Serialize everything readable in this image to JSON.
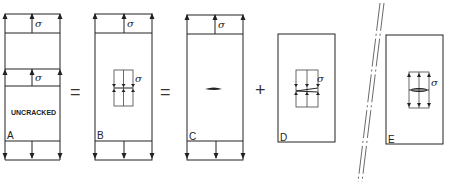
{
  "figure": {
    "panels": [
      {
        "id": "A",
        "label": "A",
        "center_text": "UNCRACKED",
        "stress_symbol_top": "σ",
        "stress_symbol_mid": "σ"
      },
      {
        "id": "B",
        "label": "B",
        "stress_symbol_top": "σ",
        "stress_symbol_inner": "σ"
      },
      {
        "id": "C",
        "label": "C",
        "stress_symbol_top": "σ"
      },
      {
        "id": "D",
        "label": "D",
        "stress_symbol_inner": "σ"
      },
      {
        "id": "E",
        "label": "E",
        "stress_symbol_inner": "σ"
      }
    ],
    "operators": [
      "=",
      "=",
      "+"
    ],
    "colors": {
      "line": "#222222",
      "background": "#ffffff"
    }
  }
}
